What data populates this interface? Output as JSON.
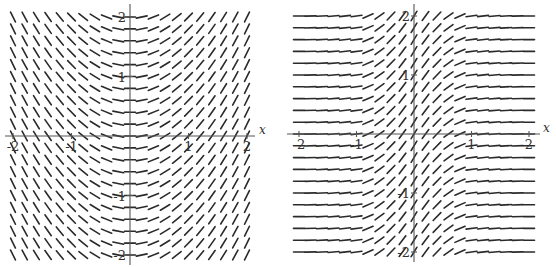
{
  "chart_data": [
    {
      "type": "slope-field",
      "title": "",
      "equation_description": "slope depends only on x; slope ≈ x",
      "xlabel": "x",
      "ylabel": "",
      "xlim": [
        -2,
        2
      ],
      "ylim": [
        -2,
        2
      ],
      "grid_step": 0.2,
      "x_ticks": [
        -2,
        -1,
        1,
        2
      ],
      "y_ticks": [
        -2,
        -1,
        1,
        2
      ],
      "x_tick_labels": [
        "-2",
        "-1",
        "1",
        "2"
      ],
      "y_tick_labels": [
        "-2",
        "-1",
        "1",
        "2"
      ],
      "slope_samples": [
        {
          "x": -2,
          "slope": -2
        },
        {
          "x": -1,
          "slope": -1
        },
        {
          "x": 0,
          "slope": 0
        },
        {
          "x": 1,
          "slope": 1
        },
        {
          "x": 2,
          "slope": 2
        }
      ],
      "layout": {
        "origin_px": [
          130,
          136
        ],
        "unit_px": [
          58.5,
          59.5
        ],
        "seg_len_px": 11,
        "axis_x_extent_px": [
          5,
          255
        ],
        "axis_y_extent_px": [
          4,
          265
        ],
        "x_label_px": [
          259,
          134
        ]
      }
    },
    {
      "type": "slope-field",
      "title": "",
      "equation_description": "slope depends only on x; bell-shaped, steepest at x=0, near zero for |x|≥1",
      "xlabel": "x",
      "ylabel": "",
      "xlim": [
        -2,
        2
      ],
      "ylim": [
        -2,
        2
      ],
      "grid_step": 0.2,
      "x_ticks": [
        -2,
        -1,
        1,
        2
      ],
      "y_ticks": [
        -2,
        -1,
        1,
        2
      ],
      "x_tick_labels": [
        "-2",
        "-1",
        "1",
        "2"
      ],
      "y_tick_labels": [
        "-2",
        "-1",
        "1",
        "2"
      ],
      "slope_samples": [
        {
          "x": -2,
          "slope": 0
        },
        {
          "x": -1,
          "slope": 0.13
        },
        {
          "x": -0.5,
          "slope": 0.85
        },
        {
          "x": 0,
          "slope": 1.6
        },
        {
          "x": 0.5,
          "slope": 0.85
        },
        {
          "x": 1,
          "slope": 0.13
        },
        {
          "x": 2,
          "slope": 0
        }
      ],
      "layout": {
        "origin_px": [
          134,
          134
        ],
        "unit_px": [
          57.5,
          59
        ],
        "seg_len_px": 11,
        "axis_x_extent_px": [
          7,
          260
        ],
        "axis_y_extent_px": [
          4,
          262
        ],
        "x_label_px": [
          263,
          132
        ]
      }
    }
  ]
}
